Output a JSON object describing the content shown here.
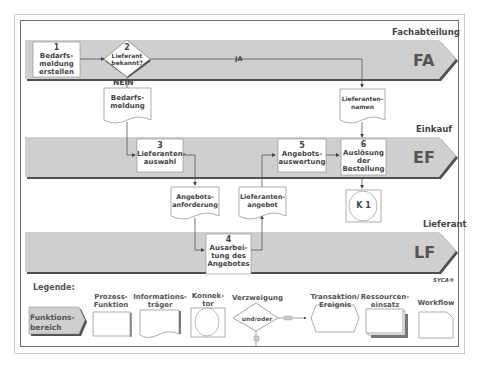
{
  "lanes": [
    {
      "name": "Fachabteilung",
      "code": "FA"
    },
    {
      "name": "Einkauf",
      "code": "EF"
    },
    {
      "name": "Lieferant",
      "code": "LF"
    }
  ],
  "process_steps": [
    {
      "number": "1",
      "label": "Bedarfs-\nmeldung\nerstellen",
      "lane": "FA"
    },
    {
      "number": "3",
      "label": "Lieferanten-\nauswahl",
      "lane": "EF"
    },
    {
      "number": "4",
      "label": "Ausarbei-\ntung des\nAngebotes",
      "lane": "LF"
    },
    {
      "number": "5",
      "label": "Angebots-\nauswertung",
      "lane": "EF"
    },
    {
      "number": "6",
      "label": "Auslösung\nder\nBestellung",
      "lane": "EF"
    }
  ],
  "decision": {
    "number": "2",
    "label": "Lieferant\nbekannt?",
    "yes_label": "JA",
    "no_label": "NEIN"
  },
  "documents": [
    {
      "label": "Bedarfs-\nmeldung"
    },
    {
      "label": "Lieferanten-\nnamen"
    },
    {
      "label": "Angebots-\nanforderung"
    },
    {
      "label": "Lieferanten-\nangebot"
    }
  ],
  "connector": {
    "label": "K 1"
  },
  "brand": "SYCA®",
  "legend": {
    "title": "Legende:",
    "items": [
      {
        "label": "Funktions-\nbereich"
      },
      {
        "label": "Prozess-\nFunktion"
      },
      {
        "label": "Informations-\nträger"
      },
      {
        "label": "Konnek-\ntor"
      },
      {
        "label": "Verzweigung",
        "inner": "und/oder"
      },
      {
        "label": "Transaktion/\nEreignis"
      },
      {
        "label": "Ressourcen-\neinsatz"
      },
      {
        "label": "Workflow"
      }
    ]
  },
  "colors": {
    "lane_fill": "#cfcfcf",
    "lane_shadow": "#505050",
    "box_fill": "#ffffff",
    "line": "#555555"
  }
}
